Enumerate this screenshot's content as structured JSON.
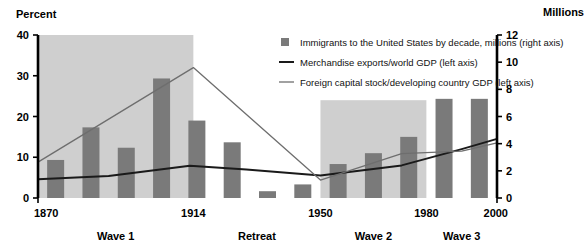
{
  "chart_data": {
    "type": "bar",
    "title": "",
    "subtitle": "",
    "ylabel": "Percent",
    "ylabel_right": "Millions",
    "xlabel": "",
    "ylim": [
      0,
      40
    ],
    "ylim_right": [
      0,
      12
    ],
    "yticks": [
      0,
      10,
      20,
      30,
      40
    ],
    "yticks_right": [
      0,
      2,
      4,
      6,
      8,
      10,
      12
    ],
    "xlim": [
      1870,
      2000
    ],
    "xticks": [
      1870,
      1914,
      1950,
      1980,
      2000
    ],
    "xtick_labels": [
      "1870",
      "1914",
      "1950",
      "1980",
      "2000"
    ],
    "grid": false,
    "legend_position": "top-right",
    "bars": {
      "name": "Immigrants to the United States by decade, millions (right axis)",
      "axis": "right",
      "color": "#7a7a7a",
      "categories": [
        "1870s",
        "1880s",
        "1890s",
        "1900s",
        "1910s",
        "1920s",
        "1930s",
        "1940s",
        "1950s",
        "1960s",
        "1970s",
        "1980s",
        "1990s"
      ],
      "x": [
        1875,
        1885,
        1895,
        1905,
        1915,
        1925,
        1935,
        1945,
        1955,
        1965,
        1975,
        1985,
        1995
      ],
      "values": [
        2.8,
        5.2,
        3.7,
        8.8,
        5.7,
        4.1,
        0.5,
        1.0,
        2.5,
        3.3,
        4.5,
        7.3,
        7.3
      ]
    },
    "series": [
      {
        "name": "Merchandise exports/world GDP (left axis)",
        "axis": "left",
        "color": "#1a1a1a",
        "width": 2.0,
        "x": [
          1870,
          1890,
          1913,
          1929,
          1950,
          1973,
          1990,
          2000
        ],
        "values": [
          4.6,
          5.4,
          7.9,
          7.0,
          5.5,
          8.0,
          12.0,
          14.5
        ]
      },
      {
        "name": "Foreign capital stock/developing country GDP  (left axis)",
        "axis": "left",
        "color": "#6e6e6e",
        "width": 1.3,
        "x": [
          1870,
          1914,
          1950,
          1973,
          1990,
          2000
        ],
        "values": [
          8.8,
          32.0,
          4.4,
          10.9,
          11.5,
          13.5
        ]
      }
    ],
    "shaded_regions": [
      {
        "label": "Wave 1",
        "x0": 1870,
        "x1": 1914,
        "color": "#cfcfcf",
        "y_top": 40
      },
      {
        "label": "Wave 2",
        "x0": 1950,
        "x1": 1980,
        "color": "#cfcfcf",
        "y_top": 24
      }
    ],
    "era_labels": [
      {
        "label": "Wave 1",
        "x": 1892
      },
      {
        "label": "Retreat",
        "x": 1932
      },
      {
        "label": "Wave 2",
        "x": 1965
      },
      {
        "label": "Wave 3",
        "x": 1990
      }
    ]
  },
  "legend": {
    "items": [
      {
        "marker": "square",
        "label": "Immigrants to the United States by decade, millions (right axis)"
      },
      {
        "marker": "line-dark",
        "label": "Merchandise exports/world GDP (left axis)"
      },
      {
        "marker": "line-gray",
        "label": "Foreign capital stock/developing country GDP  (left axis)"
      }
    ]
  },
  "colors": {
    "bar": "#7a7a7a",
    "shade": "#cfcfcf",
    "line_dark": "#1a1a1a",
    "line_gray": "#6e6e6e",
    "axis": "#000000",
    "text": "#000000"
  }
}
